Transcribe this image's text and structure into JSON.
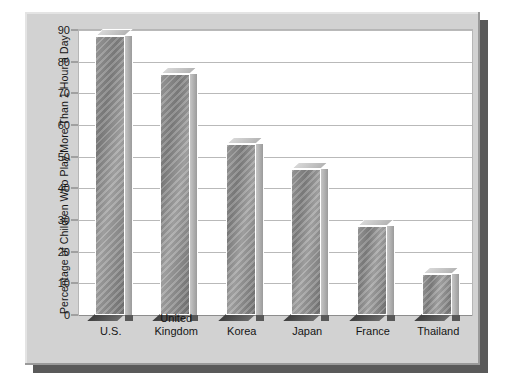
{
  "chart_data": {
    "type": "bar",
    "title": "",
    "subtitle": "",
    "xlabel": "",
    "ylabel": "Percentage of Children Who Play More Than 1 Hour a Day",
    "categories": [
      "U.S.",
      "United\nKingdom",
      "Korea",
      "Japan",
      "France",
      "Thailand"
    ],
    "values": [
      88,
      76,
      54,
      46,
      28,
      13
    ],
    "ylim": [
      0,
      90
    ],
    "ytick_values": [
      0,
      10,
      20,
      30,
      40,
      50,
      60,
      70,
      80,
      90
    ],
    "ytick_labels": [
      "0",
      "10",
      "20",
      "30",
      "40",
      "50",
      "60",
      "70",
      "80",
      "90"
    ],
    "grid": true,
    "legend": false,
    "legend_position": "none",
    "series": [
      {
        "name": "Percentage of children",
        "values": [
          88,
          76,
          54,
          46,
          28,
          13
        ]
      }
    ],
    "style": {
      "bar_style": "3d-column",
      "bar_fill": "#8a8a8a",
      "bar_side": "#b4b4b4",
      "plot_background": "#ffffff",
      "figure_background": "#d2d2d2",
      "gridline_color": "#b9b9b9",
      "shadow_color": "#5a5a5a"
    }
  }
}
